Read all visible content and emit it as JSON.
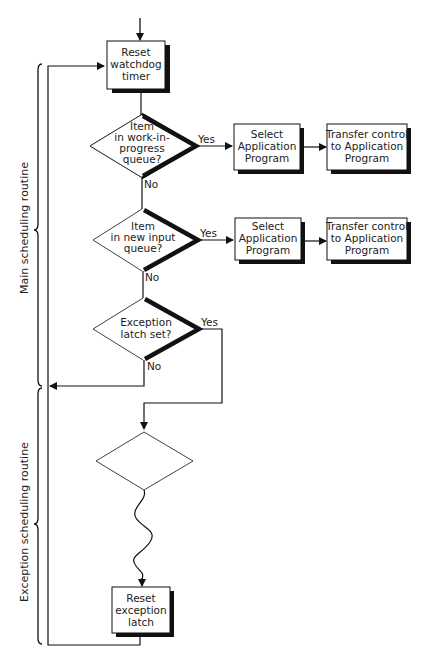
{
  "diagram": {
    "title": "",
    "groups": [
      {
        "id": "main",
        "label": "Main scheduling routine"
      },
      {
        "id": "exception",
        "label": "Exception scheduling routine"
      }
    ],
    "nodes": {
      "reset_watchdog": {
        "type": "process",
        "lines": [
          "Reset",
          "watchdog",
          "timer"
        ]
      },
      "d1": {
        "type": "decision",
        "lines": [
          "Item",
          "in work-in-",
          "progress",
          "queue?"
        ]
      },
      "select1": {
        "type": "process",
        "lines": [
          "Select",
          "Application",
          "Program"
        ]
      },
      "transfer1": {
        "type": "process",
        "lines": [
          "Transfer control",
          "to Application",
          "Program"
        ]
      },
      "d2": {
        "type": "decision",
        "lines": [
          "Item",
          "in new input",
          "queue?"
        ]
      },
      "select2": {
        "type": "process",
        "lines": [
          "Select",
          "Application",
          "Program"
        ]
      },
      "transfer2": {
        "type": "process",
        "lines": [
          "Transfer control",
          "to Application",
          "Program"
        ]
      },
      "d3": {
        "type": "decision",
        "lines": [
          "Exception",
          "latch set?"
        ]
      },
      "d4": {
        "type": "decision",
        "lines": []
      },
      "reset_latch": {
        "type": "process",
        "lines": [
          "Reset",
          "exception",
          "latch"
        ]
      }
    },
    "edge_labels": {
      "yes": "Yes",
      "no": "No"
    },
    "edges": [
      {
        "from": "entry",
        "to": "reset_watchdog"
      },
      {
        "from": "reset_watchdog",
        "to": "d1"
      },
      {
        "from": "d1",
        "to": "select1",
        "label": "Yes"
      },
      {
        "from": "select1",
        "to": "transfer1"
      },
      {
        "from": "d1",
        "to": "d2",
        "label": "No"
      },
      {
        "from": "d2",
        "to": "select2",
        "label": "Yes"
      },
      {
        "from": "select2",
        "to": "transfer2"
      },
      {
        "from": "d2",
        "to": "d3",
        "label": "No"
      },
      {
        "from": "d3",
        "to": "reset_watchdog",
        "label": "No"
      },
      {
        "from": "d3",
        "to": "d4",
        "label": "Yes"
      },
      {
        "from": "d4",
        "to": "reset_latch",
        "style": "wavy"
      },
      {
        "from": "reset_latch",
        "to": "reset_watchdog"
      }
    ]
  }
}
